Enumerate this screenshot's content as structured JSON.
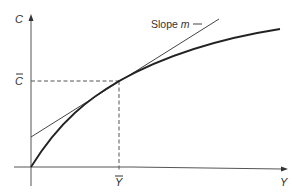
{
  "diagram": {
    "axes": {
      "y_label": "C",
      "x_label": "Y"
    },
    "markers": {
      "c_bar_label": "C",
      "y_bar_label": "Y"
    },
    "annotation": {
      "slope_text": "Slope ",
      "slope_symbol": "m"
    },
    "colors": {
      "line": "#333333",
      "curve": "#222222"
    }
  }
}
